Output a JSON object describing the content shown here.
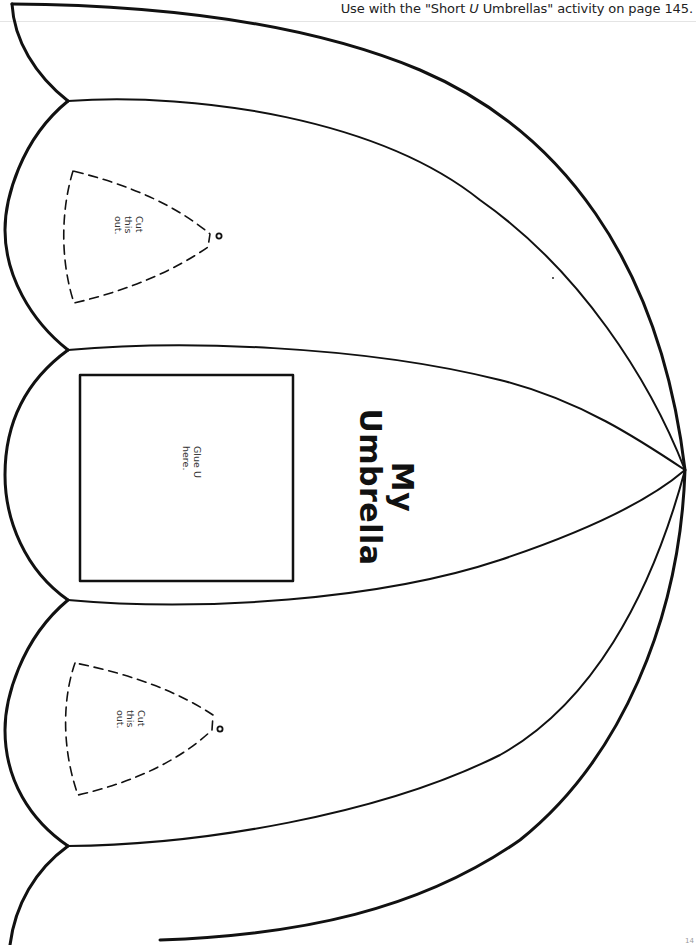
{
  "header": {
    "prefix": "Use with the \"Short ",
    "emphasis": "U",
    "suffix": " Umbrellas\" activity on page 145."
  },
  "title": {
    "line1": "My",
    "line2": "Umbrella"
  },
  "glue_box": {
    "line1": "Glue U",
    "line2": "here."
  },
  "cutouts": [
    {
      "line1": "Cut",
      "line2": "this",
      "line3": "out."
    },
    {
      "line1": "Cut",
      "line2": "this",
      "line3": "out."
    }
  ],
  "colors": {
    "outline": "#111111",
    "background": "#ffffff",
    "rule": "#e4e4e4"
  },
  "page_number_fragment": "14"
}
